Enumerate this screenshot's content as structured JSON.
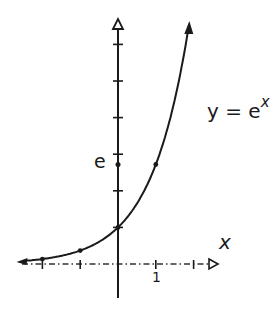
{
  "chart_data": {
    "type": "line",
    "function": "exp",
    "xlabel": "x",
    "ylabel": "",
    "xlim": [
      -2.6,
      2.6
    ],
    "ylim": [
      -1,
      6.5
    ],
    "grid": false,
    "legend": null,
    "x_ticks": [
      -2,
      -1,
      0,
      1,
      2
    ],
    "x_tick_labels": [
      {
        "value": 1,
        "label": "1"
      }
    ],
    "y_ticks": [
      1,
      2,
      3,
      4,
      5,
      6
    ],
    "y_tick_labels": [
      {
        "value": 2.718,
        "label": "e"
      }
    ],
    "marked_points": [
      {
        "x": -2,
        "y": 0.135
      },
      {
        "x": -1,
        "y": 0.368
      },
      {
        "x": 0,
        "y": 1
      },
      {
        "x": 1,
        "y": 2.718
      }
    ],
    "curve_domain": [
      -2.5,
      1.86
    ],
    "annotations": [
      "y = e^x"
    ],
    "style": "hand-drawn, black ink on white, arrows on both curve ends, hollow arrowheads on axes"
  },
  "labels": {
    "equation_base": "y = e",
    "equation_exp": "x",
    "y_special": "e",
    "x_one": "1",
    "x_axis": "x"
  },
  "colors": {
    "ink": "#1a1a1a",
    "background": "#ffffff"
  }
}
